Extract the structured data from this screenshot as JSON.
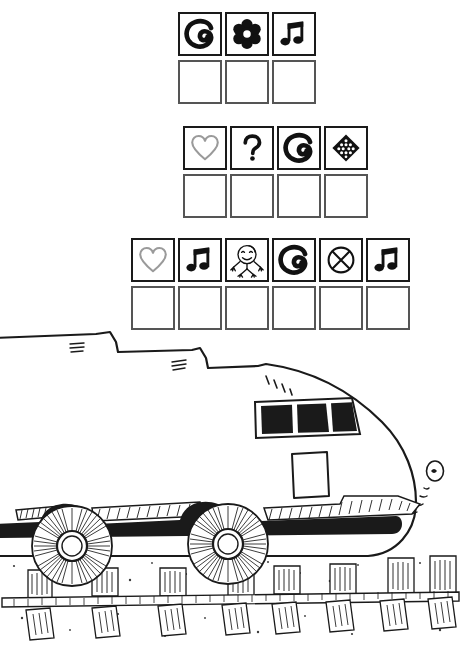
{
  "page": {
    "background_color": "#ffffff",
    "ink_color": "#1a1a1a",
    "box_border_color": "#555555",
    "accent_gray": "#9a9a9a"
  },
  "grids": [
    {
      "id": "grid-1",
      "name": "symbol-grid-3",
      "columns": 3,
      "prompt_row": [
        {
          "icon": "spiral-swirl-icon",
          "label": "spiral"
        },
        {
          "icon": "flower-star-icon",
          "label": "flower"
        },
        {
          "icon": "music-note-icon",
          "label": "music note"
        }
      ],
      "answer_row": [
        {
          "icon": "empty-box",
          "label": ""
        },
        {
          "icon": "empty-box",
          "label": ""
        },
        {
          "icon": "empty-box",
          "label": ""
        }
      ]
    },
    {
      "id": "grid-2",
      "name": "symbol-grid-4",
      "columns": 4,
      "prompt_row": [
        {
          "icon": "heart-outline-icon",
          "label": "heart"
        },
        {
          "icon": "question-mark-icon",
          "label": "question mark"
        },
        {
          "icon": "spiral-swirl-icon",
          "label": "spiral"
        },
        {
          "icon": "dotted-diamond-icon",
          "label": "dotted diamond"
        }
      ],
      "answer_row": [
        {
          "icon": "empty-box",
          "label": ""
        },
        {
          "icon": "empty-box",
          "label": ""
        },
        {
          "icon": "empty-box",
          "label": ""
        },
        {
          "icon": "empty-box",
          "label": ""
        }
      ]
    },
    {
      "id": "grid-3",
      "name": "symbol-grid-6",
      "columns": 6,
      "prompt_row": [
        {
          "icon": "heart-outline-icon",
          "label": "heart"
        },
        {
          "icon": "music-note-icon",
          "label": "music note"
        },
        {
          "icon": "stick-figure-icon",
          "label": "stick figure"
        },
        {
          "icon": "spiral-swirl-icon",
          "label": "spiral"
        },
        {
          "icon": "circle-x-icon",
          "label": "circle with X"
        },
        {
          "icon": "music-note-icon",
          "label": "music note"
        }
      ],
      "answer_row": [
        {
          "icon": "empty-box",
          "label": ""
        },
        {
          "icon": "empty-box",
          "label": ""
        },
        {
          "icon": "empty-box",
          "label": ""
        },
        {
          "icon": "empty-box",
          "label": ""
        },
        {
          "icon": "empty-box",
          "label": ""
        },
        {
          "icon": "empty-box",
          "label": ""
        }
      ]
    }
  ],
  "illustration": {
    "name": "high-speed-train-drawing",
    "subject": "high-speed train on railway track",
    "style": "black ink line drawing",
    "parts": [
      {
        "name": "train-roof-line",
        "label": "roof"
      },
      {
        "name": "train-nose",
        "label": "nose"
      },
      {
        "name": "windshield-panes",
        "label": "windshield",
        "count": 3,
        "fill": "#1a1a1a"
      },
      {
        "name": "cab-door-panel",
        "label": "door panel"
      },
      {
        "name": "headlight",
        "label": "headlight"
      },
      {
        "name": "train-wheel",
        "label": "wheel",
        "count": 2
      },
      {
        "name": "rail-track",
        "label": "rail"
      },
      {
        "name": "railway-sleeper",
        "label": "sleeper",
        "count": 13
      },
      {
        "name": "ballast-ground",
        "label": "ballast"
      },
      {
        "name": "body-stripe",
        "label": "side stripe",
        "count": 3
      }
    ]
  }
}
